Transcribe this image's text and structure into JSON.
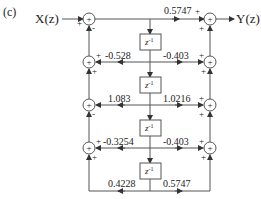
{
  "figure": {
    "label": "(c)",
    "input": "X(z)",
    "output": "Y(z)"
  },
  "delay_label": "z",
  "delay_exp": "-1",
  "coefficients": {
    "top": "0.5747",
    "row1_left": "-0.528",
    "row1_right": "-0.403",
    "row2_left": "1.083",
    "row2_right": "1.0216",
    "row3_left": "-0.3254",
    "row3_right": "-0.403",
    "bottom_left": "0.4228",
    "bottom_right": "0.5747"
  },
  "signs": {
    "plus": "+",
    "minus": "-",
    "adder": "+"
  },
  "colors": {
    "line": "#555555",
    "text": "#222222"
  }
}
